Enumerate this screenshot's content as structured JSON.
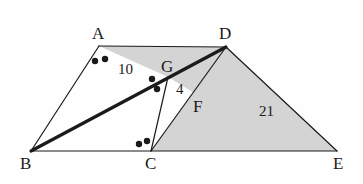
{
  "figure": {
    "background_color": "#fefefe",
    "shade_color": "#d4d4d4",
    "stroke_color": "#1a1a1a",
    "vertices": {
      "A": {
        "label": "A",
        "x": 99,
        "y": 46
      },
      "B": {
        "label": "B",
        "x": 31,
        "y": 151
      },
      "C": {
        "label": "C",
        "x": 151,
        "y": 151
      },
      "D": {
        "label": "D",
        "x": 226,
        "y": 47
      },
      "E": {
        "label": "E",
        "x": 337,
        "y": 151
      },
      "F": {
        "label": "F",
        "x": 196,
        "y": 94
      },
      "G": {
        "label": "G",
        "x": 168,
        "y": 77
      }
    },
    "measures": [
      {
        "name": "segment-ag-length",
        "label": "10",
        "x": 118,
        "y": 62
      },
      {
        "name": "segment-gf-length",
        "label": "4",
        "x": 176,
        "y": 82
      },
      {
        "name": "segment-de-length",
        "label": "21",
        "x": 259,
        "y": 104
      }
    ],
    "angle_marks": [
      {
        "name": "angle-a-dot-1",
        "x": 95,
        "y": 61,
        "r": 3.2
      },
      {
        "name": "angle-a-dot-2",
        "x": 105,
        "y": 59,
        "r": 3.2
      },
      {
        "name": "angle-g-dot-1",
        "x": 152,
        "y": 79,
        "r": 3.2
      },
      {
        "name": "angle-g-dot-2",
        "x": 157,
        "y": 89,
        "r": 3.2
      },
      {
        "name": "angle-c-dot-1",
        "x": 139,
        "y": 144,
        "r": 3.2
      },
      {
        "name": "angle-c-dot-2",
        "x": 147,
        "y": 141,
        "r": 3.2
      }
    ],
    "shaded_regions": [
      {
        "name": "region-adg",
        "points": "99,46 226,47 168,77"
      },
      {
        "name": "region-dgf",
        "points": "226,47 168,77 196,94"
      },
      {
        "name": "region-cde",
        "points": "151,151 226,47 337,151"
      }
    ],
    "edges": [
      {
        "name": "edge-ab",
        "x1": 99,
        "y1": 46,
        "x2": 31,
        "y2": 151,
        "weight": "thin"
      },
      {
        "name": "edge-ad",
        "x1": 99,
        "y1": 46,
        "x2": 226,
        "y2": 47,
        "weight": "thin"
      },
      {
        "name": "edge-be",
        "x1": 31,
        "y1": 151,
        "x2": 337,
        "y2": 151,
        "weight": "thin"
      },
      {
        "name": "edge-de",
        "x1": 226,
        "y1": 47,
        "x2": 337,
        "y2": 151,
        "weight": "thin"
      },
      {
        "name": "edge-cd",
        "x1": 151,
        "y1": 151,
        "x2": 226,
        "y2": 47,
        "weight": "thin"
      },
      {
        "name": "edge-cg",
        "x1": 151,
        "y1": 151,
        "x2": 168,
        "y2": 77,
        "weight": "thin"
      },
      {
        "name": "edge-bd",
        "x1": 31,
        "y1": 151,
        "x2": 226,
        "y2": 47,
        "weight": "bold"
      }
    ]
  }
}
